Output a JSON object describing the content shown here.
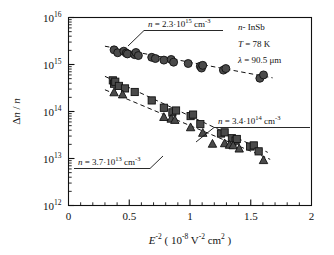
{
  "figure": {
    "name": "semilog-scatter-plot",
    "background": "#ffffff",
    "ink_color": "#111111",
    "marker_fill": "#4a4a4a",
    "marker_stroke": "#111111"
  },
  "axes": {
    "x": {
      "label_base": "E",
      "label_exp": "-2",
      "label_units_open": "(",
      "label_units_mant": "10",
      "label_units_mant_exp": "-8",
      "label_units_v": "V",
      "label_units_v_exp": "-2",
      "label_units_cm": "cm",
      "label_units_cm_exp": "2",
      "label_units_close": ")",
      "ticks": [
        "0",
        "0.5",
        "1",
        "1.5",
        "2"
      ],
      "min": 0,
      "max": 2,
      "minor_per_major": 5
    },
    "y": {
      "label_delta": "Δ",
      "label_n1": "n",
      "label_slash": "/",
      "label_n2": "n",
      "ticks": [
        {
          "mant": "10",
          "exp": "12",
          "value": 1000000000000.0
        },
        {
          "mant": "10",
          "exp": "13",
          "value": 10000000000000.0
        },
        {
          "mant": "10",
          "exp": "14",
          "value": 100000000000000.0
        },
        {
          "mant": "10",
          "exp": "15",
          "value": 1000000000000000.0
        },
        {
          "mant": "10",
          "exp": "16",
          "value": 1e+16
        }
      ],
      "min": 1000000000000.0,
      "max": 1e+16,
      "scale": "log"
    }
  },
  "legend": {
    "lines": [
      {
        "name": "material",
        "italic_prefix": "n",
        "rest": "- InSb"
      },
      {
        "name": "temperature",
        "italic_prefix": "T",
        "rest": " = 78 K"
      },
      {
        "name": "wavelength",
        "italic_prefix": "λ",
        "rest": " = 90.5 μm"
      }
    ]
  },
  "annotations": [
    {
      "id": "ann-circles",
      "var": "n",
      "eq": " = 2.3·10",
      "exp": "15",
      "units": " cm",
      "units_exp": "-3",
      "series": "circles"
    },
    {
      "id": "ann-squares",
      "var": "n",
      "eq": " = 3.4·10",
      "exp": "14",
      "units": " cm",
      "units_exp": "-3",
      "series": "squares"
    },
    {
      "id": "ann-triangles",
      "var": "n",
      "eq": " = 3.7·10",
      "exp": "13",
      "units": " cm",
      "units_exp": "-3",
      "series": "triangles"
    }
  ],
  "chart_data": {
    "type": "scatter",
    "title": "",
    "xlabel": "E^-2 ( 10^-8 V^-2 cm^2 )",
    "ylabel": "Δn / n",
    "xlim": [
      0,
      2
    ],
    "ylim": [
      1000000000000.0,
      1e+16
    ],
    "yscale": "log",
    "grid": false,
    "legend_position": "top-right",
    "series": [
      {
        "name": "n = 2.3·10^15 cm^-3",
        "marker": "circle",
        "color": "#4a4a4a",
        "points": [
          [
            0.375,
            2050000000000000.0
          ],
          [
            0.405,
            1780000000000000.0
          ],
          [
            0.455,
            1920000000000000.0
          ],
          [
            0.475,
            1750000000000000.0
          ],
          [
            0.485,
            1680000000000000.0
          ],
          [
            0.545,
            1620000000000000.0
          ],
          [
            0.555,
            1800000000000000.0
          ],
          [
            0.575,
            1550000000000000.0
          ],
          [
            0.685,
            1420000000000000.0
          ],
          [
            0.715,
            1340000000000000.0
          ],
          [
            0.785,
            1240000000000000.0
          ],
          [
            0.845,
            1280000000000000.0
          ],
          [
            0.865,
            1120000000000000.0
          ],
          [
            0.985,
            1050000000000000.0
          ],
          [
            1.085,
            920000000000000.0
          ],
          [
            1.095,
            840000000000000.0
          ],
          [
            1.105,
            960000000000000.0
          ],
          [
            1.275,
            760000000000000.0
          ],
          [
            1.295,
            820000000000000.0
          ],
          [
            1.575,
            510000000000000.0
          ],
          [
            1.605,
            600000000000000.0
          ]
        ],
        "fit_line": {
          "x1": 0.3,
          "y1": 2450000000000000.0,
          "x2": 1.68,
          "y2": 520000000000000.0,
          "style": "dashed"
        }
      },
      {
        "name": "n = 3.4·10^14 cm^-3",
        "marker": "square",
        "color": "#4a4a4a",
        "points": [
          [
            0.365,
            460000000000000.0
          ],
          [
            0.375,
            390000000000000.0
          ],
          [
            0.385,
            430000000000000.0
          ],
          [
            0.415,
            350000000000000.0
          ],
          [
            0.465,
            310000000000000.0
          ],
          [
            0.545,
            260000000000000.0
          ],
          [
            0.685,
            172000000000000.0
          ],
          [
            0.785,
            120000000000000.0
          ],
          [
            0.855,
            96000000000000.0
          ],
          [
            0.885,
            105000000000000.0
          ],
          [
            1.005,
            80000000000000.0
          ],
          [
            1.025,
            86000000000000.0
          ],
          [
            1.085,
            54000000000000.0
          ],
          [
            1.255,
            34000000000000.0
          ],
          [
            1.285,
            36000000000000.0
          ],
          [
            1.345,
            27000000000000.0
          ],
          [
            1.375,
            24000000000000.0
          ],
          [
            1.385,
            26000000000000.0
          ],
          [
            1.495,
            18000000000000.0
          ],
          [
            1.525,
            19000000000000.0
          ],
          [
            1.565,
            14200000000000.0
          ]
        ],
        "fit_line": {
          "x1": 0.3,
          "y1": 560000000000000.0,
          "x2": 1.64,
          "y2": 13500000000000.0,
          "style": "dashed"
        }
      },
      {
        "name": "n = 3.7·10^13 cm^-3",
        "marker": "triangle",
        "color": "#4a4a4a",
        "points": [
          [
            0.375,
            255000000000000.0
          ],
          [
            0.445,
            230000000000000.0
          ],
          [
            0.785,
            76000000000000.0
          ],
          [
            0.845,
            70000000000000.0
          ],
          [
            0.875,
            66000000000000.0
          ],
          [
            1.005,
            46000000000000.0
          ],
          [
            1.105,
            35000000000000.0
          ],
          [
            1.185,
            20500000000000.0
          ],
          [
            1.285,
            21000000000000.0
          ],
          [
            1.325,
            19500000000000.0
          ],
          [
            1.355,
            19000000000000.0
          ],
          [
            1.405,
            16200000000000.0
          ],
          [
            1.605,
            9200000000000.0
          ]
        ],
        "fit_line": {
          "x1": 0.3,
          "y1": 290000000000000.0,
          "x2": 1.66,
          "y2": 9600000000000.0,
          "style": "dashed"
        }
      }
    ]
  }
}
